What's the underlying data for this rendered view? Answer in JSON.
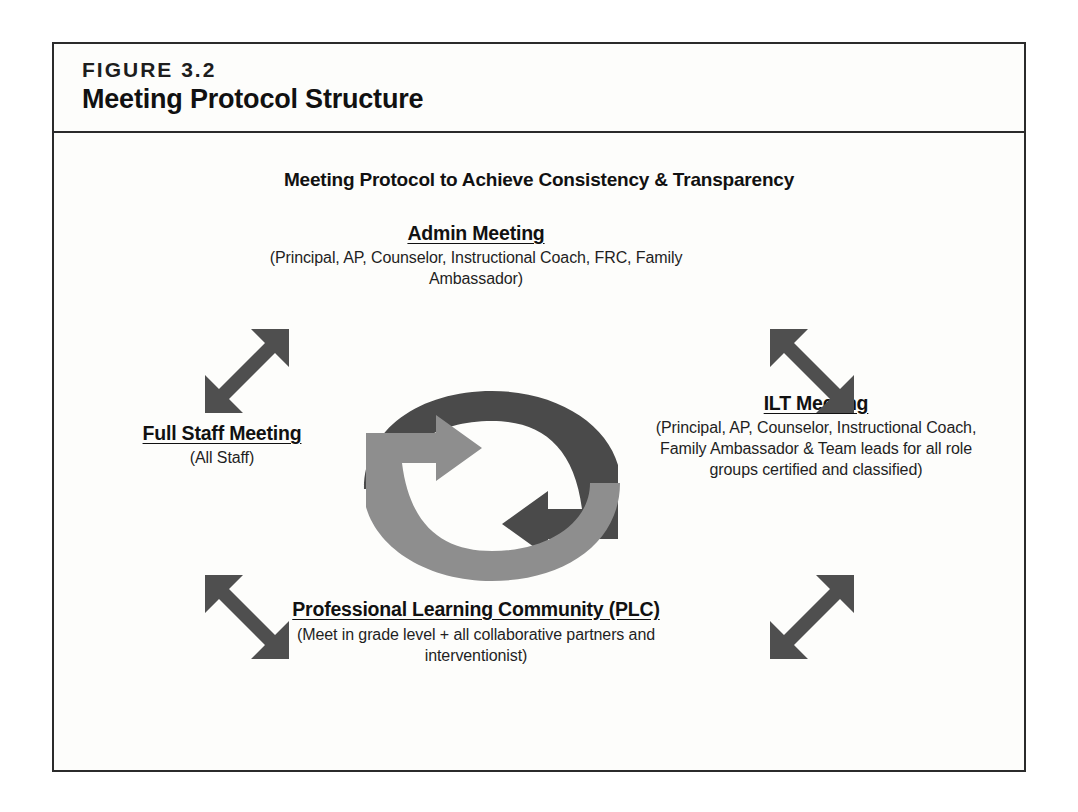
{
  "figure": {
    "label": "FIGURE 3.2",
    "title": "Meeting Protocol Structure"
  },
  "diagram": {
    "subtitle": "Meeting Protocol to Achieve Consistency & Transparency",
    "nodes": [
      {
        "id": "admin",
        "title": "Admin Meeting",
        "detail": "(Principal, AP, Counselor, Instructional Coach, FRC, Family Ambassador)",
        "position": "top"
      },
      {
        "id": "ilt",
        "title": "ILT Meeting",
        "detail": "(Principal, AP, Counselor, Instructional Coach, Family Ambassador & Team leads for all role groups certified and classified)",
        "position": "right"
      },
      {
        "id": "plc",
        "title": "Professional Learning Community (PLC)",
        "detail": "(Meet in grade level + all collaborative partners and interventionist)",
        "position": "bottom"
      },
      {
        "id": "fullstaff",
        "title": "Full Staff Meeting",
        "detail": "(All Staff)",
        "position": "left"
      }
    ],
    "connectors": [
      {
        "id": "top-left",
        "icon": "double-headed-diagonal-arrow",
        "direction": "northeast-southwest"
      },
      {
        "id": "top-right",
        "icon": "double-headed-diagonal-arrow",
        "direction": "northwest-southeast"
      },
      {
        "id": "bottom-left",
        "icon": "double-headed-diagonal-arrow",
        "direction": "northwest-southeast"
      },
      {
        "id": "bottom-right",
        "icon": "double-headed-diagonal-arrow",
        "direction": "northeast-southwest"
      }
    ],
    "cycle": {
      "icon": "circular-cycle-arrows",
      "arcs": [
        {
          "id": "dark-arc",
          "color": "#4a4a4a",
          "direction": "clockwise-top-left-to-bottom-right"
        },
        {
          "id": "light-arc",
          "color": "#8e8e8e",
          "direction": "clockwise-bottom-left-to-top-center"
        }
      ]
    }
  },
  "colors": {
    "frame": "#2b2b2b",
    "page_background": "#ffffff",
    "figure_background": "#fdfdfb",
    "text": "#111111",
    "arrow_dark": "#4a4a4a",
    "arrow_light": "#8e8e8e",
    "connector_arrow": "#4f4f4f"
  }
}
